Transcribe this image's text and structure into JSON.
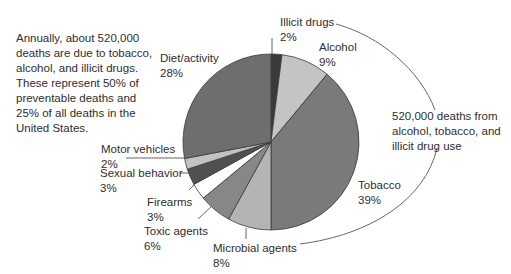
{
  "chart_data": {
    "type": "pie",
    "title": "",
    "start_angle_deg": 0,
    "direction": "clockwise",
    "categories": [
      "Illicit drugs",
      "Alcohol",
      "Tobacco",
      "Microbial agents",
      "Toxic agents",
      "Firearms",
      "Sexual behavior",
      "Motor vehicles",
      "Diet/activity"
    ],
    "values": [
      2,
      9,
      39,
      8,
      6,
      3,
      3,
      2,
      28
    ],
    "unit": "%",
    "colors": [
      "#3a3a3a",
      "#c4c4c4",
      "#7a7a7a",
      "#b4b4b4",
      "#878787",
      "#ffffff",
      "#505050",
      "#c2c2c2",
      "#6e6e6e"
    ],
    "labels": [
      {
        "name": "Illicit drugs",
        "pct": "2%"
      },
      {
        "name": "Alcohol",
        "pct": "9%"
      },
      {
        "name": "Tobacco",
        "pct": "39%"
      },
      {
        "name": "Microbial agents",
        "pct": "8%"
      },
      {
        "name": "Toxic agents",
        "pct": "6%"
      },
      {
        "name": "Firearms",
        "pct": "3%"
      },
      {
        "name": "Sexual behavior",
        "pct": "3%"
      },
      {
        "name": "Motor vehicles",
        "pct": "2%"
      },
      {
        "name": "Diet/activity",
        "pct": "28%"
      }
    ],
    "annotations": [
      "Annually, about 520,000 deaths are due to tobacco, alcohol, and illicit drugs. These represent 50% of preventable deaths and 25% of all deaths in the United States.",
      "520,000 deaths from alcohol, tobacco, and illicit drug use"
    ],
    "legend": "none (direct labels)"
  },
  "notes": {
    "left": "Annually, about 520,000\ndeaths are due to tobacco,\nalcohol, and illicit drugs.\nThese represent 50% of\npreventable deaths and\n25% of all deaths in the\nUnited States.",
    "right": "520,000 deaths from\nalcohol, tobacco, and\nillicit drug use"
  }
}
